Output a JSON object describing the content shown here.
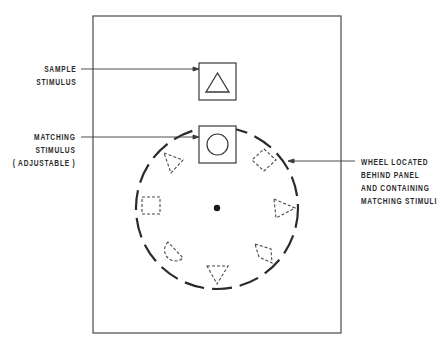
{
  "diagram": {
    "type": "apparatus-schematic",
    "panel": {
      "x": 93,
      "y": 16,
      "width": 248,
      "height": 317
    },
    "labels": {
      "sample": {
        "lines": [
          "SAMPLE",
          "STIMULUS"
        ]
      },
      "matching": {
        "lines": [
          "MATCHING",
          "STIMULUS",
          "( ADJUSTABLE )"
        ]
      },
      "wheel": {
        "lines": [
          "WHEEL LOCATED",
          "BEHIND PANEL",
          "AND CONTAINING",
          "MATCHING STIMULI"
        ]
      }
    },
    "sample_window": {
      "shape": "triangle",
      "x": 199,
      "y": 63,
      "size": 37
    },
    "matching_window": {
      "shape": "circle",
      "x": 199,
      "y": 126,
      "size": 37
    },
    "wheel": {
      "center": [
        217,
        208
      ],
      "radius": 81,
      "hub": "center-dot",
      "stimuli": [
        "circle",
        "diamond",
        "triangle-right",
        "diamond",
        "triangle-down",
        "semicircle",
        "square",
        "triangle-left"
      ]
    },
    "colors": {
      "line": "#3a3a3a",
      "background": "#ffffff"
    }
  }
}
